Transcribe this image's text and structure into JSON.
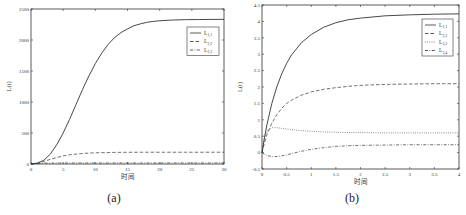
{
  "chart_data": [
    {
      "id": "a",
      "type": "line",
      "panel_label": "(a)",
      "title": "",
      "xlabel": "时间",
      "ylabel": "L(t)",
      "xlim": [
        0,
        30
      ],
      "ylim": [
        0,
        2500
      ],
      "xticks": [
        0,
        5,
        10,
        15,
        20,
        25,
        30
      ],
      "yticks": [
        0,
        500,
        1000,
        1500,
        2000,
        2500
      ],
      "grid": false,
      "legend_position": "upper right",
      "x": [
        0,
        1,
        2,
        3,
        4,
        5,
        6,
        7,
        8,
        9,
        10,
        11,
        12,
        13,
        14,
        15,
        16,
        17,
        18,
        19,
        20,
        22,
        24,
        26,
        28,
        30
      ],
      "series": [
        {
          "name": "L1,1",
          "base": "L",
          "sub": "1,1",
          "style": "solid",
          "values": [
            0,
            15,
            60,
            160,
            310,
            500,
            720,
            960,
            1200,
            1420,
            1620,
            1790,
            1930,
            2040,
            2120,
            2180,
            2230,
            2260,
            2285,
            2300,
            2310,
            2322,
            2328,
            2330,
            2332,
            2333
          ]
        },
        {
          "name": "L2,2",
          "base": "L",
          "sub": "2,2",
          "style": "dashed",
          "values": [
            0,
            10,
            40,
            75,
            105,
            130,
            148,
            160,
            170,
            176,
            180,
            183,
            185,
            187,
            188,
            189,
            189,
            190,
            190,
            190,
            190,
            190,
            190,
            190,
            190,
            190
          ]
        },
        {
          "name": "L3,3",
          "base": "L",
          "sub": "3,3",
          "style": "dashdot",
          "values": [
            0,
            8,
            13,
            15,
            16,
            17,
            17,
            17,
            17,
            17,
            17,
            17,
            17,
            17,
            17,
            17,
            17,
            17,
            17,
            17,
            17,
            17,
            17,
            17,
            17,
            17
          ]
        }
      ]
    },
    {
      "id": "b",
      "type": "line",
      "panel_label": "(b)",
      "title": "",
      "xlabel": "时间",
      "ylabel": "L(t)",
      "xlim": [
        0,
        4
      ],
      "ylim": [
        -0.5,
        4.5
      ],
      "xticks": [
        0,
        0.5,
        1,
        1.5,
        2,
        2.5,
        3,
        3.5,
        4
      ],
      "yticks": [
        -0.5,
        0,
        0.5,
        1,
        1.5,
        2,
        2.5,
        3,
        3.5,
        4,
        4.5
      ],
      "grid": false,
      "legend_position": "upper right",
      "x": [
        0,
        0.05,
        0.1,
        0.2,
        0.3,
        0.4,
        0.5,
        0.6,
        0.8,
        1.0,
        1.25,
        1.5,
        1.75,
        2.0,
        2.5,
        3.0,
        3.5,
        4.0
      ],
      "series": [
        {
          "name": "L1,1",
          "base": "L",
          "sub": "1,1",
          "style": "solid",
          "values": [
            0,
            0.45,
            0.85,
            1.5,
            2.0,
            2.4,
            2.72,
            2.98,
            3.35,
            3.6,
            3.82,
            3.96,
            4.05,
            4.1,
            4.17,
            4.2,
            4.22,
            4.23
          ]
        },
        {
          "name": "L2,2",
          "base": "L",
          "sub": "2,2",
          "style": "dashed",
          "values": [
            0,
            0.3,
            0.55,
            0.9,
            1.15,
            1.35,
            1.5,
            1.6,
            1.75,
            1.85,
            1.93,
            1.98,
            2.02,
            2.05,
            2.08,
            2.09,
            2.1,
            2.1
          ]
        },
        {
          "name": "L3,3",
          "base": "L",
          "sub": "3,3",
          "style": "dotted",
          "values": [
            0,
            0.45,
            0.65,
            0.76,
            0.76,
            0.74,
            0.72,
            0.7,
            0.67,
            0.65,
            0.63,
            0.62,
            0.61,
            0.61,
            0.6,
            0.6,
            0.6,
            0.6
          ]
        },
        {
          "name": "L3,4",
          "base": "L",
          "sub": "3,4",
          "style": "dashdot",
          "values": [
            0,
            -0.05,
            -0.09,
            -0.12,
            -0.12,
            -0.1,
            -0.07,
            -0.03,
            0.04,
            0.1,
            0.15,
            0.19,
            0.21,
            0.22,
            0.23,
            0.24,
            0.24,
            0.24
          ]
        }
      ]
    }
  ]
}
